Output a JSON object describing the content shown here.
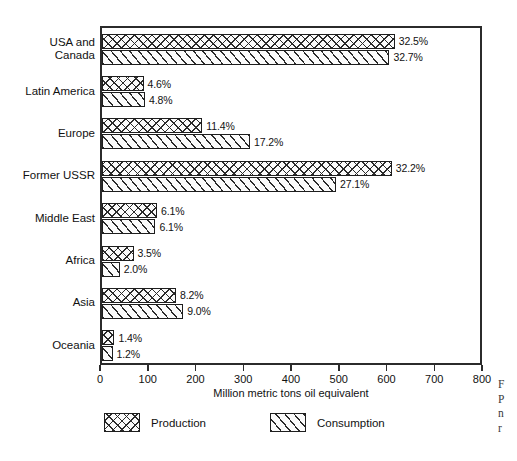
{
  "chart_data": {
    "type": "bar",
    "orientation": "horizontal",
    "title": "",
    "xlabel": "Million metric tons oil equivalent",
    "ylabel": "",
    "xlim": [
      0,
      800
    ],
    "xticks": [
      0,
      100,
      200,
      300,
      400,
      500,
      600,
      700,
      800
    ],
    "xtick_labels": [
      "0",
      "100",
      "200",
      "300",
      "400",
      "500",
      "600",
      "700",
      "800"
    ],
    "grid": false,
    "legend_position": "below-axes",
    "categories": [
      "USA and\nCanada",
      "Latin America",
      "Europe",
      "Former USSR",
      "Middle East",
      "Africa",
      "Asia",
      "Oceania"
    ],
    "series": [
      {
        "name": "Production",
        "pattern": "cross-hatch",
        "values": [
          613,
          87,
          210,
          607,
          115,
          66,
          155,
          26
        ],
        "labels": [
          "32.5%",
          "4.6%",
          "11.4%",
          "32.2%",
          "6.1%",
          "3.5%",
          "8.2%",
          "1.4%"
        ]
      },
      {
        "name": "Consumption",
        "pattern": "diagonal-hatch",
        "values": [
          602,
          90,
          310,
          490,
          112,
          37,
          170,
          22
        ],
        "labels": [
          "32.7%",
          "4.8%",
          "17.2%",
          "27.1%",
          "6.1%",
          "2.0%",
          "9.0%",
          "1.2%"
        ]
      }
    ]
  },
  "legend": {
    "items": [
      {
        "label": "Production",
        "pattern": "production"
      },
      {
        "label": "Consumption",
        "pattern": "consumption"
      }
    ]
  },
  "side_caption": {
    "lines": [
      "F",
      "P",
      "n",
      "r"
    ]
  },
  "colors": {
    "axis": "#2b2b2b",
    "hatch": "#2a2a2a",
    "bar_fill": "#fbfbfb",
    "text": "#111111",
    "page_background": "#ffffff"
  }
}
